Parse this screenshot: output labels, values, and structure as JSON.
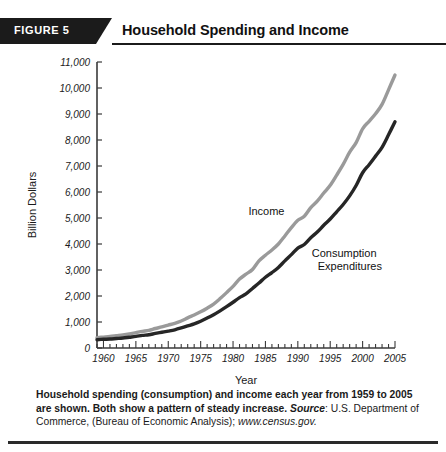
{
  "figure": {
    "badge_label": "FIGURE 5",
    "title": "Household Spending and Income"
  },
  "caption": {
    "lead": "Household spending (consumption) and income each year from 1959 to 2005 are shown. Both show a pattern of steady increase.",
    "source_word": "Source",
    "source_rest": ": U.S. Department of Commerce, (Bureau of Economic Analysis); ",
    "url": "www.census.gov."
  },
  "chart_data": {
    "type": "line",
    "title": "Household Spending and Income",
    "xlabel": "Year",
    "ylabel": "Billion Dollars",
    "xlim": [
      1959,
      2005
    ],
    "ylim": [
      0,
      11000
    ],
    "grid": false,
    "legend_position": "inline-annotations",
    "x_major_ticks": [
      1960,
      1965,
      1970,
      1975,
      1980,
      1985,
      1990,
      1995,
      2000,
      2005
    ],
    "x_minor_tick_interval": 1,
    "y_ticks": [
      0,
      1000,
      2000,
      3000,
      4000,
      5000,
      6000,
      7000,
      8000,
      9000,
      10000,
      11000
    ],
    "y_tick_labels": [
      "0",
      "1,000",
      "2,000",
      "3,000",
      "4,000",
      "5,000",
      "6,000",
      "7,000",
      "8,000",
      "9,000",
      "10,000",
      "11,000"
    ],
    "colors": {
      "income": "#9a9a9a",
      "consumption": "#262626"
    },
    "x": [
      1959,
      1960,
      1961,
      1962,
      1963,
      1964,
      1965,
      1966,
      1967,
      1968,
      1969,
      1970,
      1971,
      1972,
      1973,
      1974,
      1975,
      1976,
      1977,
      1978,
      1979,
      1980,
      1981,
      1982,
      1983,
      1984,
      1985,
      1986,
      1987,
      1988,
      1989,
      1990,
      1991,
      1992,
      1993,
      1994,
      1995,
      1996,
      1997,
      1998,
      1999,
      2000,
      2001,
      2002,
      2003,
      2004,
      2005
    ],
    "series": [
      {
        "name": "Income",
        "label": "Income",
        "color": "#9a9a9a",
        "values": [
          400,
          420,
          440,
          470,
          500,
          540,
          590,
          640,
          680,
          750,
          810,
          880,
          950,
          1040,
          1160,
          1270,
          1390,
          1530,
          1690,
          1900,
          2130,
          2370,
          2650,
          2840,
          3020,
          3350,
          3570,
          3770,
          4000,
          4310,
          4630,
          4910,
          5070,
          5400,
          5650,
          5960,
          6260,
          6650,
          7060,
          7530,
          7900,
          8430,
          8720,
          9010,
          9370,
          9930,
          10500
        ]
      },
      {
        "name": "Consumption Expenditures",
        "label_line1": "Consumption",
        "label_line2": "Expenditures",
        "color": "#262626",
        "values": [
          320,
          335,
          345,
          365,
          385,
          415,
          445,
          485,
          510,
          560,
          605,
          650,
          700,
          770,
          850,
          930,
          1030,
          1150,
          1280,
          1430,
          1590,
          1760,
          1940,
          2080,
          2290,
          2500,
          2720,
          2900,
          3100,
          3350,
          3590,
          3840,
          3980,
          4240,
          4460,
          4720,
          4960,
          5240,
          5520,
          5850,
          6250,
          6740,
          7050,
          7380,
          7720,
          8200,
          8700
        ]
      }
    ],
    "annotations": [
      {
        "text": "Income",
        "x": 1987,
        "y": 5100
      },
      {
        "text": "Consumption Expenditures",
        "x": 1994,
        "y": 3500
      }
    ]
  }
}
